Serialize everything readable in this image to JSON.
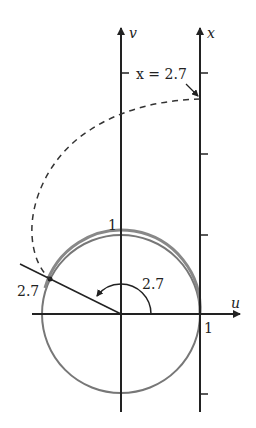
{
  "diagram": {
    "axes": {
      "v_label": "v",
      "x_label": "x",
      "u_label": "u"
    },
    "labels": {
      "x_equals": "x = 2.7",
      "one_top": "1",
      "one_right": "1",
      "angle": "2.7",
      "arc_point": "2.7"
    },
    "colors": {
      "axis": "#222222",
      "circle": "#777777",
      "dashed": "#333333"
    }
  }
}
